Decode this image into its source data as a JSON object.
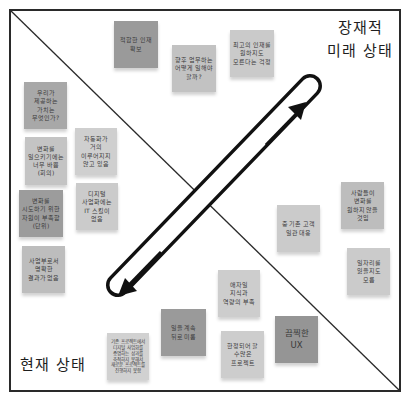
{
  "diagram": {
    "title_future": [
      "장재적",
      "미래 상태"
    ],
    "title_current": "현재 상태",
    "colors": {
      "frame": "#2a2a2a",
      "diagonal": "#2a2a2a",
      "arrow": "#111111",
      "note_dark": "#9a9a9a",
      "note_mid": "#a8a8a8",
      "note_light": "#cbcbcb"
    },
    "arrow": {
      "shape": "double-headed-arrow-in-pill",
      "icon_up": "arrow-up-right-icon",
      "icon_down": "arrow-down-left-icon"
    },
    "notes": [
      {
        "text": "적합한 인재 확보",
        "x": 114,
        "y": 21,
        "w": 44,
        "h": 47,
        "color": "#9a9a9a",
        "size": "normal"
      },
      {
        "text": "향후 업무하는 어떻게 일해야 할까?",
        "x": 172,
        "y": 45,
        "w": 44,
        "h": 47,
        "color": "#c2c2c2",
        "size": "normal"
      },
      {
        "text": "최고의 인재를 원하지도 모른다는 걱정",
        "x": 230,
        "y": 30,
        "w": 44,
        "h": 47,
        "color": "#cacaca",
        "size": "normal"
      },
      {
        "text": "우리가 제공하는 가치는 무엇인가?",
        "x": 24,
        "y": 82,
        "w": 43,
        "h": 47,
        "color": "#a8a8a8",
        "size": "normal"
      },
      {
        "text": "변화를 일으키기에는 너무 바쁨 (회의)",
        "x": 25,
        "y": 137,
        "w": 42,
        "h": 48,
        "color": "#c4c4c4",
        "size": "normal"
      },
      {
        "text": "자동화가 거의 이루어지지 않고 있음",
        "x": 75,
        "y": 128,
        "w": 42,
        "h": 47,
        "color": "#cfcfcf",
        "size": "normal"
      },
      {
        "text": "변화를 시도하기 위한 자원이 부족함 (단위)",
        "x": 19,
        "y": 190,
        "w": 44,
        "h": 47,
        "color": "#9c9c9c",
        "size": "normal"
      },
      {
        "text": "디지털 사업화에는 IT 스킬이 없음",
        "x": 76,
        "y": 183,
        "w": 42,
        "h": 47,
        "color": "#cbcbcb",
        "size": "normal"
      },
      {
        "text": "사업부로서 명확한 결과가 없음",
        "x": 22,
        "y": 246,
        "w": 43,
        "h": 47,
        "color": "#bdbdbd",
        "size": "normal"
      },
      {
        "text": "중 기존 고객 일관 대응",
        "x": 277,
        "y": 205,
        "w": 43,
        "h": 47,
        "color": "#cbcbcb",
        "size": "normal"
      },
      {
        "text": "사람들이 변화를 원하지 않을 것임",
        "x": 341,
        "y": 182,
        "w": 43,
        "h": 47,
        "color": "#bdbdbd",
        "size": "normal"
      },
      {
        "text": "일자리를 잃을지도 모름",
        "x": 347,
        "y": 248,
        "w": 43,
        "h": 47,
        "color": "#cbcbcb",
        "size": "normal"
      },
      {
        "text": "애자일 지식과 역량의 부족",
        "x": 218,
        "y": 270,
        "w": 42,
        "h": 47,
        "color": "#cdcdcd",
        "size": "normal"
      },
      {
        "text": "일을 계속 뒤로 미룸",
        "x": 161,
        "y": 309,
        "w": 45,
        "h": 47,
        "color": "#9a9a9a",
        "size": "normal"
      },
      {
        "text": "기존 프로젝트에서 디지털 사업화를 증명하는 성과를 축적하지 못해서 새로운 프로젝트를 진행하지 못함",
        "x": 107,
        "y": 333,
        "w": 42,
        "h": 47,
        "color": "#d1d1d1",
        "size": "tiny"
      },
      {
        "text": "한정되어 할 수많은 프로젝트",
        "x": 221,
        "y": 331,
        "w": 43,
        "h": 47,
        "color": "#cdcdcd",
        "size": "normal"
      },
      {
        "text": "끔찍한 UX",
        "x": 275,
        "y": 316,
        "w": 43,
        "h": 47,
        "color": "#959595",
        "size": "big"
      }
    ]
  }
}
